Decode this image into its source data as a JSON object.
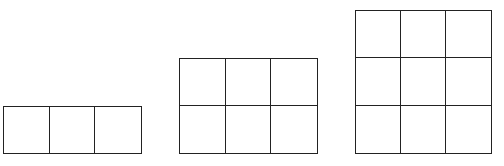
{
  "diagram": {
    "title": "",
    "line_color": "#222222",
    "background": "#ffffff",
    "grids": [
      {
        "name": "grid-1x3",
        "rows": 1,
        "cols": 3,
        "x": 3,
        "y": 106,
        "width": 139,
        "height": 48
      },
      {
        "name": "grid-2x3",
        "rows": 2,
        "cols": 3,
        "x": 179,
        "y": 58,
        "width": 139,
        "height": 96
      },
      {
        "name": "grid-3x3",
        "rows": 3,
        "cols": 3,
        "x": 355,
        "y": 10,
        "width": 137,
        "height": 144
      }
    ]
  }
}
